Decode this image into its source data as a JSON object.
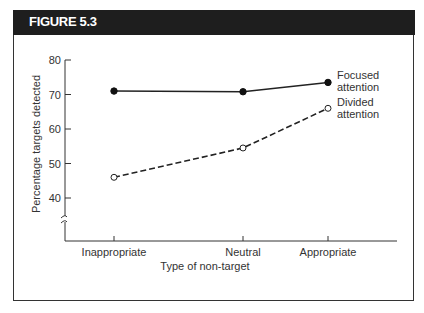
{
  "figure": {
    "title": "FIGURE 5.3"
  },
  "chart_data": {
    "type": "line",
    "title": "",
    "xlabel": "Type of non-target",
    "ylabel": "Percentage targets detected",
    "categories": [
      "Inappropriate",
      "Neutral",
      "Appropriate"
    ],
    "yticks": [
      40,
      50,
      60,
      70,
      80
    ],
    "ylim": [
      40,
      80
    ],
    "axis_break": true,
    "grid": false,
    "series": [
      {
        "name": "Focused attention",
        "label_lines": [
          "Focused",
          "attention"
        ],
        "style": "solid",
        "marker": "filled-circle",
        "values": [
          71,
          70.8,
          73.5
        ]
      },
      {
        "name": "Divided attention",
        "label_lines": [
          "Divided",
          "attention"
        ],
        "style": "dashed",
        "marker": "open-circle",
        "values": [
          46,
          54.5,
          66
        ]
      }
    ],
    "legend": "inline-right"
  }
}
